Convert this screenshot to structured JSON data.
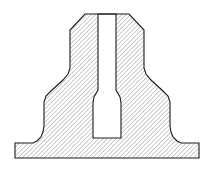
{
  "document": {
    "title": "Sectioned Pedestal Bracket",
    "view_type": "cross-section",
    "background_color": "#ffffff"
  },
  "style": {
    "outline_color": "#1a1a1a",
    "outline_width": 1.1,
    "hatch_color": "#4d4d4d",
    "hatch_width": 0.55,
    "hatch_spacing": 3.1,
    "hatch_angle_deg": 45,
    "fill_color": "#ffffff",
    "cavity_fill": "#ffffff"
  },
  "geometry": {
    "part_outline_path": "M 15 158 L 15 143 L 33 143 L 37 141 L 41 137 L 43 132 L 44 126 L 44 102 L 46 96 L 51 91 L 63 80 L 68 74 L 70 68 L 70 30 L 85 14 L 129 14 L 144 30 L 144 68 L 146 74 L 151 80 L 163 91 L 168 96 L 170 102 L 170 126 L 171 132 L 173 137 L 177 141 L 181 143 L 199 143 L 199 158 Z",
    "cavity_path": "M 98 14 L 98 90 L 94 97 L 93 103 L 93 138 L 121 138 L 121 103 L 120 97 L 116 90 L 116 14 Z",
    "key_vertices": {
      "top_face_left": [
        85,
        14
      ],
      "top_face_right": [
        129,
        14
      ],
      "chamfer_left_base": [
        70,
        30
      ],
      "chamfer_right_base": [
        144,
        30
      ],
      "web_left": [
        70,
        68
      ],
      "web_right": [
        144,
        68
      ],
      "shoulder_left": [
        44,
        102
      ],
      "shoulder_right": [
        170,
        102
      ],
      "flange_top_left": [
        15,
        143
      ],
      "flange_top_right": [
        199,
        143
      ],
      "bottom_left": [
        15,
        158
      ],
      "bottom_right": [
        199,
        158
      ]
    },
    "cavity_vertices": {
      "slot_mouth_left": [
        98,
        14
      ],
      "slot_mouth_right": [
        116,
        14
      ],
      "slot_neck_left": [
        98,
        90
      ],
      "slot_neck_right": [
        116,
        90
      ],
      "slot_wide_left": [
        93,
        103
      ],
      "slot_wide_right": [
        121,
        103
      ],
      "slot_floor_left": [
        93,
        138
      ],
      "slot_floor_right": [
        121,
        138
      ]
    }
  },
  "features": [
    {
      "id": "top-face",
      "label": "Top face"
    },
    {
      "id": "top-chamfer-left",
      "label": "Left top chamfer"
    },
    {
      "id": "top-chamfer-right",
      "label": "Right top chamfer"
    },
    {
      "id": "upright-web",
      "label": "Vertical web"
    },
    {
      "id": "taper-left",
      "label": "Left tapered flank"
    },
    {
      "id": "taper-right",
      "label": "Right tapered flank"
    },
    {
      "id": "fillet-left",
      "label": "Left base fillet"
    },
    {
      "id": "fillet-right",
      "label": "Right base fillet"
    },
    {
      "id": "base-flange",
      "label": "Base flange"
    },
    {
      "id": "central-slot",
      "label": "Central blind slot"
    },
    {
      "id": "slot-flare",
      "label": "Slot relief flare"
    }
  ]
}
